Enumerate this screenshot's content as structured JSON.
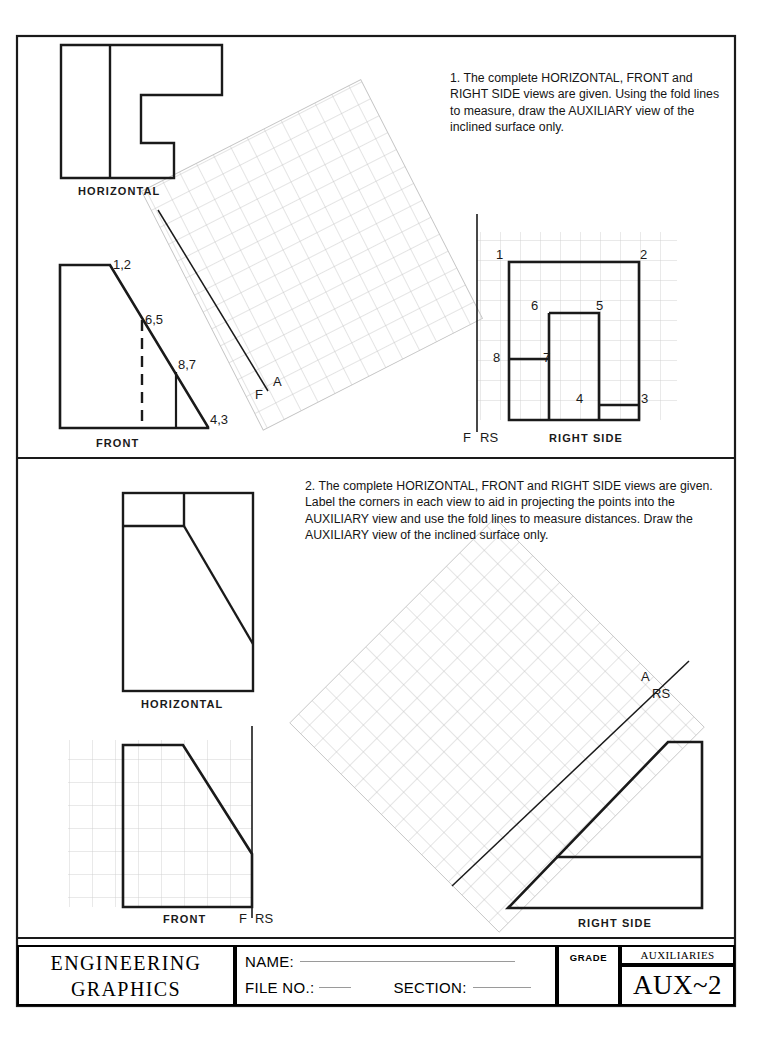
{
  "sheet": {
    "border_color": "#1a1a1a"
  },
  "problems": [
    {
      "number": "1",
      "instruction": "1.  The complete HORIZONTAL, FRONT and RIGHT SIDE views are given. Using the fold lines to measure, draw the AUXILIARY view of the inclined surface only.",
      "views": [
        {
          "name": "horizontal",
          "label": "HORIZONTAL"
        },
        {
          "name": "front",
          "label": "FRONT"
        },
        {
          "name": "right-side",
          "label": "RIGHT SIDE"
        }
      ],
      "fold_lines": [
        {
          "name": "front-auxiliary",
          "upper": "A",
          "lower": "F"
        },
        {
          "name": "front-right-side",
          "left": "F",
          "right": "RS"
        }
      ],
      "front_point_labels": [
        "1,2",
        "6,5",
        "8,7",
        "4,3"
      ],
      "right_side_point_labels": [
        "1",
        "2",
        "6",
        "5",
        "8",
        "7",
        "4",
        "3"
      ]
    },
    {
      "number": "2",
      "instruction": "2.  The complete HORIZONTAL, FRONT and RIGHT SIDE views are given. Label the corners in each view to aid in projecting the points into the AUXILIARY view and use the fold lines to measure distances.  Draw the AUXILIARY view of the inclined surface only.",
      "views": [
        {
          "name": "horizontal",
          "label": "HORIZONTAL"
        },
        {
          "name": "front",
          "label": "FRONT"
        },
        {
          "name": "right-side",
          "label": "RIGHT  SIDE"
        }
      ],
      "fold_lines": [
        {
          "name": "auxiliary-right-side",
          "upper": "A",
          "lower": "RS"
        },
        {
          "name": "front-right-side",
          "left": "F",
          "right": "RS"
        }
      ],
      "front_point_labels": [],
      "right_side_point_labels": []
    }
  ],
  "title_block": {
    "course_line1": "ENGINEERING",
    "course_line2": "GRAPHICS",
    "name_label": "NAME:",
    "file_no_label": "FILE NO.:",
    "section_label": "SECTION:",
    "name_value": "",
    "file_no_value": "",
    "section_value": "",
    "grade_label": "GRADE",
    "grade_value": "",
    "unit_title": "AUXILIARIES",
    "sheet_number": "AUX~2"
  },
  "colors": {
    "line": "#1a1a1a",
    "grid": "#c8c8c8",
    "grid_light": "#d4d4d4",
    "paper": "#ffffff"
  }
}
